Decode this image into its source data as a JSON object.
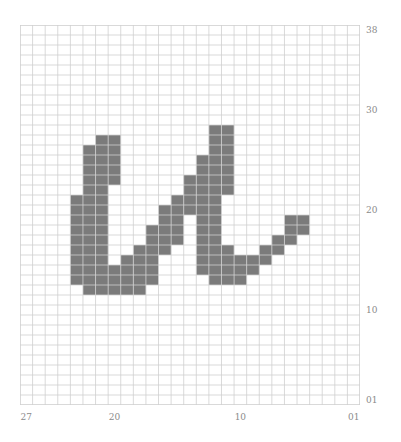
{
  "figure": {
    "type": "pixel-grid-glyph",
    "grid": {
      "columns": 27,
      "rows": 38,
      "line_color": "#cfcfcf",
      "fill_color": "#7b7b7b",
      "background": "#ffffff"
    },
    "y_axis_labels": [
      {
        "text": "38",
        "row": 0
      },
      {
        "text": "30",
        "row": 8
      },
      {
        "text": "20",
        "row": 18
      },
      {
        "text": "10",
        "row": 28
      },
      {
        "text": "01",
        "row": 37
      }
    ],
    "x_axis_labels": [
      {
        "text": "27",
        "col": 0
      },
      {
        "text": "20",
        "col": 7
      },
      {
        "text": "10",
        "col": 17
      },
      {
        "text": "01",
        "col": 26
      }
    ],
    "filled_runs": [
      [
        4,
        17,
        25
      ],
      [
        5,
        12,
        26
      ],
      [
        6,
        11,
        26
      ],
      [
        7,
        11,
        15
      ],
      [
        7,
        24,
        26
      ],
      [
        8,
        23,
        26
      ],
      [
        9,
        22,
        26
      ],
      [
        10,
        20,
        25
      ],
      [
        11,
        18,
        22
      ],
      [
        12,
        17,
        21
      ],
      [
        13,
        15,
        18
      ],
      [
        14,
        13,
        24
      ],
      [
        15,
        10,
        25
      ],
      [
        16,
        10,
        16
      ],
      [
        16,
        22,
        25
      ],
      [
        17,
        23,
        25
      ],
      [
        18,
        23,
        24
      ],
      [
        19,
        22,
        23
      ],
      [
        20,
        21,
        22
      ],
      [
        21,
        19,
        21
      ],
      [
        22,
        19,
        20
      ]
    ]
  }
}
